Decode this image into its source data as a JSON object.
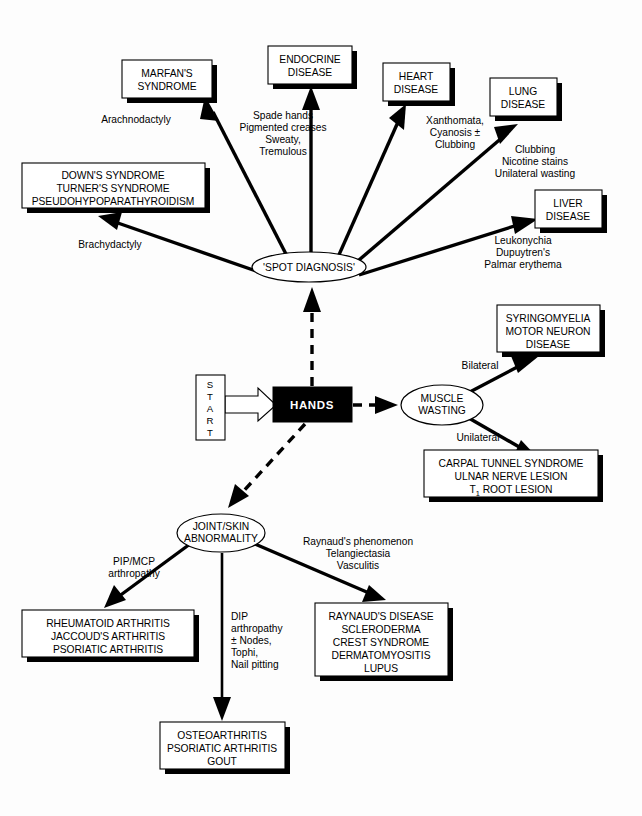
{
  "diagram": {
    "root": {
      "start_label_letters": [
        "S",
        "T",
        "A",
        "R",
        "T"
      ],
      "start_label": "START",
      "hands_label": "HANDS"
    },
    "nodes": {
      "spot_diagnosis": "'SPOT DIAGNOSIS'",
      "muscle_wasting_line1": "MUSCLE",
      "muscle_wasting_line2": "WASTING",
      "joint_skin_line1": "JOINT/SKIN",
      "joint_skin_line2": "ABNORMALITY"
    },
    "boxes": {
      "marfan": [
        "MARFAN'S",
        "SYNDROME"
      ],
      "endocrine": [
        "ENDOCRINE",
        "DISEASE"
      ],
      "heart": [
        "HEART",
        "DISEASE"
      ],
      "lung": [
        "LUNG",
        "DISEASE"
      ],
      "liver": [
        "LIVER",
        "DISEASE"
      ],
      "downs": [
        "DOWN'S SYNDROME",
        "TURNER'S SYNDROME",
        "PSEUDOHYPOPARATHYROIDISM"
      ],
      "syringomyelia": [
        "SYRINGOMYELIA",
        "MOTOR NEURON",
        "DISEASE"
      ],
      "carpal": [
        "CARPAL TUNNEL SYNDROME",
        "ULNAR NERVE LESION",
        "T₁ ROOT LESION"
      ],
      "carpal_line3_prefix": "T",
      "carpal_line3_sub": "1",
      "carpal_line3_suffix": " ROOT LESION",
      "rheumatoid": [
        "RHEUMATOID ARTHRITIS",
        "JACCOUD'S ARTHRITIS",
        "PSORIATIC ARTHRITIS"
      ],
      "osteoarthritis": [
        "OSTEOARTHRITIS",
        "PSORIATIC ARTHRITIS",
        "GOUT"
      ],
      "raynauds": [
        "RAYNAUD'S DISEASE",
        "SCLERODERMA",
        "CREST SYNDROME",
        "DERMATOMYOSITIS",
        "LUPUS"
      ]
    },
    "edge_labels": {
      "arachnodactyly": [
        "Arachnodactyly"
      ],
      "spade_hands": [
        "Spade hands",
        "Pigmented creases",
        "Sweaty,",
        "Tremulous"
      ],
      "xanthomata": [
        "Xanthomata,",
        "Cyanosis ±",
        "Clubbing"
      ],
      "clubbing_lung": [
        "Clubbing",
        "Nicotine stains",
        "Unilateral wasting"
      ],
      "leukonychia": [
        "Leukonychia",
        "Dupuytren's",
        "Palmar erythema"
      ],
      "brachydactyly": [
        "Brachydactyly"
      ],
      "bilateral": [
        "Bilateral"
      ],
      "unilateral": [
        "Unilateral"
      ],
      "pip_mcp": [
        "PIP/MCP",
        "arthropathy"
      ],
      "dip": [
        "DIP",
        "arthropathy",
        "± Nodes,",
        "Tophi,",
        "Nail pitting"
      ],
      "raynauds_phenomenon": [
        "Raynaud's phenomenon",
        "Telangiectasia",
        "Vasculitis"
      ]
    },
    "colors": {
      "background": "#fdfdfd",
      "stroke": "#000000",
      "box_fill": "#ffffff",
      "hands_fill": "#000000",
      "hands_text": "#ffffff"
    }
  }
}
